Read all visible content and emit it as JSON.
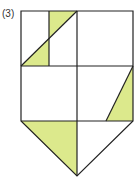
{
  "figure": {
    "label": "(3)",
    "fill_color": "#dce98c",
    "stroke_color": "#222222"
  }
}
